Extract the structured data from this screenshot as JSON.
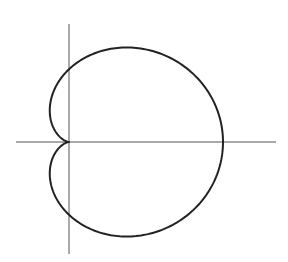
{
  "chart_data": {
    "type": "line",
    "title": "",
    "xlabel": "",
    "ylabel": "",
    "equation": "r = a(1 + cos θ)",
    "grid": false,
    "legend": null,
    "parameters": {
      "a": 1
    },
    "key_points": [
      {
        "label": "cusp",
        "x": 0,
        "y": 0
      },
      {
        "label": "rightmost",
        "x": 2,
        "y": 0
      },
      {
        "label": "y-intercept-top",
        "x": 0,
        "y": 1
      },
      {
        "label": "y-intercept-bottom",
        "x": 0,
        "y": -1
      },
      {
        "label": "leftmost-upper",
        "x": -0.25,
        "y": 0.433
      },
      {
        "label": "leftmost-lower",
        "x": -0.25,
        "y": -0.433
      }
    ],
    "xlim": [
      -0.7,
      2.7
    ],
    "ylim": [
      -1.5,
      1.5
    ]
  },
  "figure": {
    "stroke_color": "#222222",
    "axis_color": "#555555",
    "origin_px": [
      69,
      142
    ],
    "scale_px": 77,
    "y_scale_factor": 0.945,
    "x_axis_px": [
      16,
      276
    ],
    "y_axis_px": [
      24,
      254
    ]
  }
}
